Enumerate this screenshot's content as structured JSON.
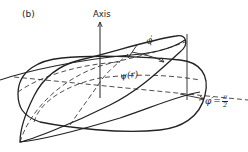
{
  "figure": {
    "panel_label": "(b)",
    "axis_label": "Axis",
    "phi_prime_label": "φ′",
    "psi_label": "ψ(r)",
    "phi_eq": {
      "lhs": "φ′=",
      "numerator": "π",
      "denominator": "2"
    }
  },
  "style": {
    "stroke_color": "#222222",
    "background": "#ffffff"
  }
}
